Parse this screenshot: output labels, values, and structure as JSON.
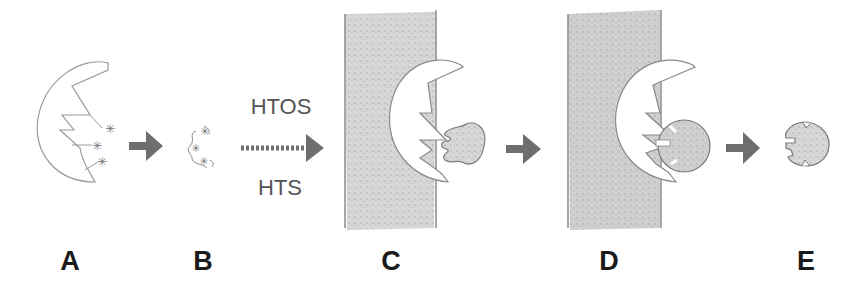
{
  "diagram": {
    "type": "process-flow",
    "colors": {
      "outline": "#8a8a8a",
      "arrow": "#6e6e6e",
      "surface_fill": "#d4d4d4",
      "ligand_fill": "#d9d9d9",
      "label": "#1a1a1a"
    },
    "steps": [
      {
        "id": "A",
        "label": "A",
        "description": "receptor crescent with three starred binding sites"
      },
      {
        "id": "B",
        "label": "B",
        "description": "small scaffold fragments with star markers"
      },
      {
        "id": "C",
        "label": "C",
        "description": "receptor immobilized on surface binding notched ligand"
      },
      {
        "id": "D",
        "label": "D",
        "description": "receptor on surface with round ligand docked"
      },
      {
        "id": "E",
        "label": "E",
        "description": "released notched ligand"
      }
    ],
    "arrows": [
      {
        "from": "A",
        "to": "B",
        "style": "solid"
      },
      {
        "from": "B",
        "to": "C",
        "style": "dotted",
        "label_top": "HTOS",
        "label_bottom": "HTS"
      },
      {
        "from": "C",
        "to": "D",
        "style": "solid"
      },
      {
        "from": "D",
        "to": "E",
        "style": "solid"
      }
    ]
  }
}
